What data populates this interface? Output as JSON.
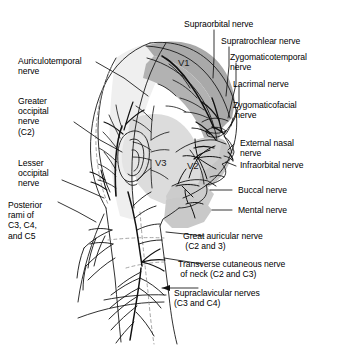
{
  "figure": {
    "background_color": "#ffffff",
    "line_color": "#000000",
    "shades": {
      "v1_band": "#a9a9a9",
      "v2_region": "#c9c9c9",
      "v3_region": "#dcdcdc",
      "scalp_light": "#efefef"
    }
  },
  "territories": [
    {
      "id": "v1",
      "label": "V1"
    },
    {
      "id": "v2",
      "label": "V2"
    },
    {
      "id": "v3",
      "label": "V3"
    }
  ],
  "labels": {
    "supraorbital": "Supraorbital nerve",
    "supratrochlear": "Supratrochlear nerve",
    "zygomaticotemporal": "Zygomaticotemporal\nnerve",
    "lacrimal": "Lacrimal nerve",
    "zygomaticofacial": "Zygomaticofacial\n nerve",
    "external_nasal": "External nasal\nnerve",
    "infraorbital": "Infraorbital nerve",
    "buccal": "Buccal nerve",
    "mental": "Mental nerve",
    "great_auricular": "Great auricular nerve\n (C2 and 3)",
    "transverse_cutaneous": "Transverse cutaneous nerve\n of neck (C2 and C3)",
    "supraclavicular": "Supraclavicular nerves\n(C3 and C4)",
    "auriculotemporal": "Auriculotemporal\nnerve",
    "greater_occipital": "Greater\noccipital\nnerve\n(C2)",
    "lesser_occipital": "Lesser\noccipital\nnerve",
    "posterior_rami": "Posterior\nrami of\nC3, C4,\nand C5"
  }
}
